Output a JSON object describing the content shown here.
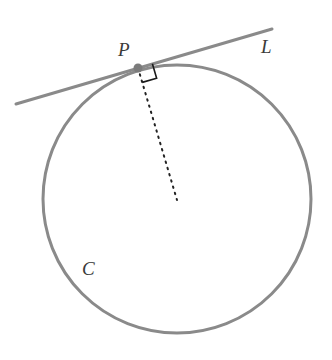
{
  "figure": {
    "kind": "geometry-diagram",
    "background_color": "#ffffff",
    "width": 332,
    "height": 360
  },
  "style": {
    "curve_color": "#8a8a8a",
    "tangent_color": "#8a8a8a",
    "radius_color": "#222222",
    "right_angle_color": "#1a1a1a",
    "point_color": "#7b7b7b",
    "label_color": "#3a3a3a",
    "curve_width": 3,
    "tangent_width": 3,
    "radius_width": 2,
    "label_font_size": 19
  },
  "labels": {
    "point": "P",
    "line": "L",
    "circle": "C"
  },
  "chart_data": {
    "type": "scatter",
    "title": "",
    "xlabel": "",
    "ylabel": "",
    "xlim": [
      0,
      332
    ],
    "ylim": [
      0,
      360
    ],
    "grid": false,
    "legend": "none",
    "elements": [
      {
        "name": "circle-C",
        "label": "C",
        "shape": "circle",
        "center": [
          177,
          199
        ],
        "radius": 134,
        "stroke": "#8a8a8a",
        "stroke_width": 3,
        "fill": "none"
      },
      {
        "name": "tangent-line-L",
        "label": "L",
        "shape": "line",
        "from": [
          16,
          104
        ],
        "to": [
          272,
          29
        ],
        "stroke": "#8a8a8a",
        "stroke_width": 3
      },
      {
        "name": "tangent-point-P",
        "label": "P",
        "shape": "point",
        "position": [
          138,
          68
        ],
        "radius": 4.5,
        "fill": "#7b7b7b"
      },
      {
        "name": "radius-segment",
        "shape": "line",
        "from": [
          138,
          68
        ],
        "to": [
          177,
          200
        ],
        "stroke": "#222222",
        "stroke_width": 2,
        "dash": "1.5 5"
      },
      {
        "name": "right-angle-marker",
        "shape": "square",
        "vertex": [
          138,
          68
        ],
        "size": 15,
        "stroke": "#1a1a1a",
        "stroke_width": 1.6,
        "fill": "none"
      }
    ],
    "annotations": [
      {
        "text": "P",
        "position": [
          118,
          56
        ],
        "style": "italic-serif"
      },
      {
        "text": "L",
        "position": [
          261,
          53
        ],
        "style": "italic-serif"
      },
      {
        "text": "C",
        "position": [
          82,
          275
        ],
        "style": "italic-serif"
      }
    ]
  }
}
